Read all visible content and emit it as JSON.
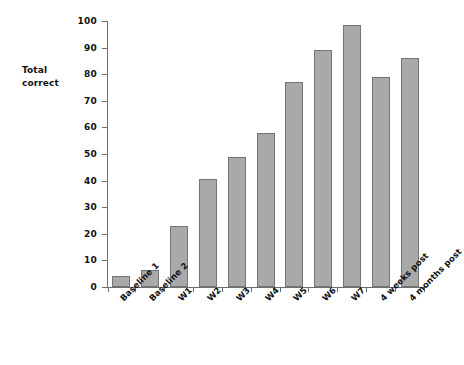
{
  "axis_title": "Total correct",
  "axis_title_lines": [
    "Total",
    "correct"
  ],
  "chart_data": {
    "type": "bar",
    "title": "",
    "xlabel": "",
    "ylabel": "Total correct",
    "ylim": [
      0,
      100
    ],
    "ytick_step": 10,
    "yticks": [
      0,
      10,
      20,
      30,
      40,
      50,
      60,
      70,
      80,
      90,
      100
    ],
    "ytick_labels": [
      "0",
      "10",
      "20",
      "30",
      "40",
      "50",
      "60",
      "70",
      "80",
      "90",
      "100"
    ],
    "grid": false,
    "legend": false,
    "bar_color": "#a9a9a9",
    "bar_edge_color": "#757575",
    "categories": [
      "Baseline 1",
      "Baseline 2",
      "W1",
      "W2",
      "W3",
      "W4",
      "W5",
      "W6",
      "W7",
      "4 weeks post",
      "4 months post"
    ],
    "values": [
      4,
      6.5,
      23,
      40.5,
      49,
      58,
      77,
      89,
      98.5,
      79,
      86
    ]
  }
}
